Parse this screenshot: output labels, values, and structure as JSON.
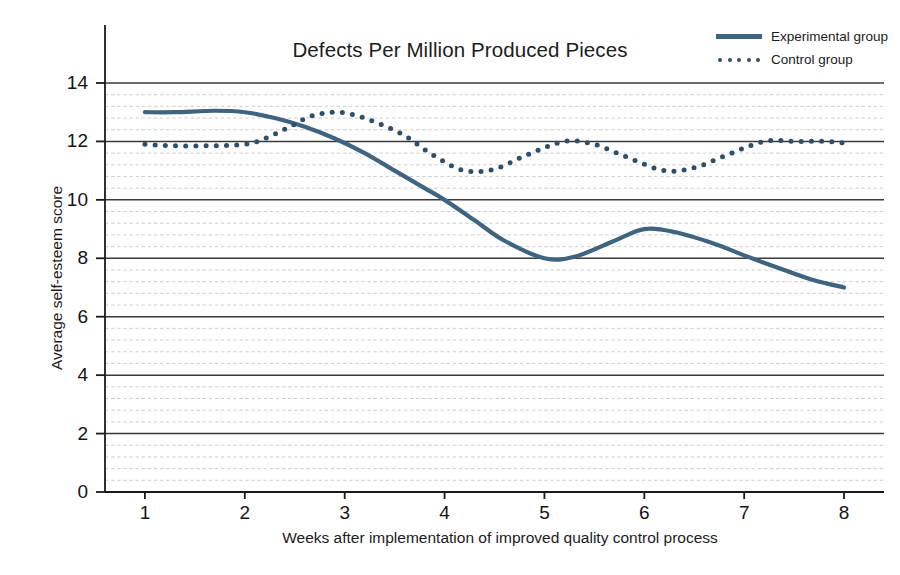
{
  "chart_data": {
    "type": "line",
    "title": "Defects Per Million Produced Pieces",
    "xlabel": "Weeks after implementation of improved quality control process",
    "ylabel": "Average self-esteem score",
    "xlim": [
      0.6,
      8.4
    ],
    "ylim": [
      0,
      14
    ],
    "xticks": [
      "1",
      "2",
      "3",
      "4",
      "5",
      "6",
      "7",
      "8"
    ],
    "xtick_values": [
      1,
      2,
      3,
      4,
      5,
      6,
      7,
      8
    ],
    "yticks": [
      "0",
      "2",
      "4",
      "6",
      "8",
      "10",
      "12",
      "14"
    ],
    "ytick_values": [
      0,
      2,
      4,
      6,
      8,
      10,
      12,
      14
    ],
    "grid": {
      "major_y_step": 2,
      "minor_y_step": 0.4,
      "major_style": "solid",
      "minor_style": "dashed",
      "vertical_grid": false
    },
    "legend_position": "top-right",
    "colors": {
      "line": "#3e6480",
      "dots": "#2f4f68",
      "major_grid": "#3a3a3a",
      "minor_grid": "#c9c9c9",
      "axis": "#1a1a1a",
      "background": "#ffffff"
    },
    "series": [
      {
        "name": "Experimental group",
        "style": "solid",
        "x": [
          1.0,
          1.3,
          1.7,
          2.0,
          2.3,
          2.6,
          2.9,
          3.2,
          3.5,
          3.8,
          4.0,
          4.3,
          4.6,
          5.0,
          5.3,
          5.7,
          6.0,
          6.3,
          6.7,
          7.0,
          7.4,
          7.7,
          8.0
        ],
        "values": [
          13.0,
          13.0,
          13.05,
          13.0,
          12.8,
          12.5,
          12.1,
          11.6,
          11.0,
          10.4,
          10.0,
          9.3,
          8.6,
          8.0,
          8.05,
          8.6,
          9.0,
          8.9,
          8.5,
          8.1,
          7.6,
          7.25,
          7.0
        ]
      },
      {
        "name": "Control group",
        "style": "dotted",
        "x": [
          1.0,
          1.3,
          1.6,
          2.0,
          2.2,
          2.45,
          2.65,
          2.9,
          3.1,
          3.35,
          3.6,
          3.9,
          4.2,
          4.5,
          4.8,
          5.2,
          5.5,
          5.8,
          6.2,
          6.5,
          6.8,
          7.2,
          7.5,
          7.8,
          8.0
        ],
        "values": [
          11.9,
          11.85,
          11.85,
          11.9,
          12.1,
          12.5,
          12.85,
          13.0,
          12.9,
          12.6,
          12.2,
          11.5,
          11.0,
          11.05,
          11.5,
          12.0,
          11.9,
          11.5,
          11.0,
          11.1,
          11.5,
          12.0,
          12.0,
          12.0,
          11.95
        ]
      }
    ]
  },
  "legend": {
    "items": [
      {
        "label": "Experimental group",
        "style": "solid"
      },
      {
        "label": "Control group",
        "style": "dotted"
      }
    ]
  }
}
